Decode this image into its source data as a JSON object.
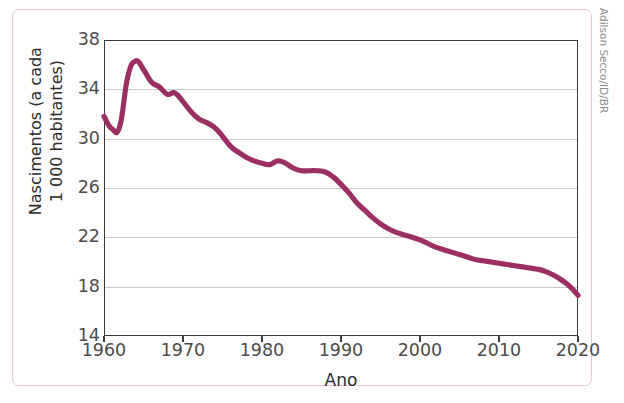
{
  "figure": {
    "title": "Brasil: taxa de natalidade (1960-2020)",
    "attribution": "Adilson Secco/ID/BR",
    "line_color": "#9c2f62",
    "grid_color": "#c9c9c9",
    "frame_color": "#e8c9d6"
  },
  "chart_data": {
    "type": "line",
    "title": "Brasil: taxa de natalidade (1960-2020)",
    "xlabel": "Ano",
    "ylabel": "Nascimentos (a cada 1 000 habitantes)",
    "ylabel_line1": "Nascimentos (a cada",
    "ylabel_line2": "1 000 habitantes)",
    "xlim": [
      1960,
      2020
    ],
    "ylim": [
      14,
      38
    ],
    "xticks": [
      1960,
      1970,
      1980,
      1990,
      2000,
      2010,
      2020
    ],
    "yticks": [
      14,
      18,
      22,
      26,
      30,
      34,
      38
    ],
    "grid": "horizontal",
    "legend": "none",
    "series": [
      {
        "name": "Taxa de natalidade",
        "color": "#9c2f62",
        "x": [
          1960,
          1961,
          1962,
          1963,
          1964,
          1965,
          1966,
          1967,
          1968,
          1969,
          1970,
          1971,
          1972,
          1973,
          1974,
          1975,
          1976,
          1977,
          1978,
          1979,
          1980,
          1981,
          1982,
          1983,
          1984,
          1985,
          1986,
          1987,
          1988,
          1989,
          1990,
          1991,
          1992,
          1993,
          1994,
          1995,
          1996,
          1997,
          1998,
          1999,
          2000,
          2001,
          2002,
          2003,
          2004,
          2005,
          2006,
          2007,
          2008,
          2009,
          2010,
          2011,
          2012,
          2013,
          2014,
          2015,
          2016,
          2017,
          2018,
          2019,
          2020
        ],
        "values": [
          31.8,
          30.8,
          31.0,
          35.0,
          36.3,
          35.6,
          34.6,
          34.2,
          33.6,
          33.7,
          33.0,
          32.2,
          31.6,
          31.3,
          30.9,
          30.2,
          29.4,
          28.9,
          28.5,
          28.2,
          28.0,
          27.9,
          28.2,
          28.0,
          27.6,
          27.4,
          27.4,
          27.4,
          27.3,
          26.9,
          26.3,
          25.6,
          24.8,
          24.2,
          23.6,
          23.1,
          22.7,
          22.4,
          22.2,
          22.0,
          21.8,
          21.5,
          21.2,
          21.0,
          20.8,
          20.6,
          20.4,
          20.2,
          20.1,
          20.0,
          19.9,
          19.8,
          19.7,
          19.6,
          19.5,
          19.4,
          19.2,
          18.9,
          18.5,
          18.0,
          17.3
        ]
      }
    ]
  }
}
